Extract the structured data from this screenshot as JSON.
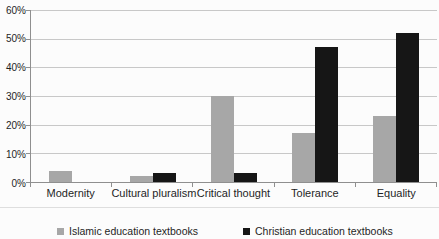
{
  "chart_data": {
    "type": "bar",
    "title": "",
    "categories": [
      "Modernity",
      "Cultural pluralism",
      "Critical thought",
      "Tolerance",
      "Equality"
    ],
    "series": [
      {
        "name": "Islamic education textbooks",
        "color": "#a7a7a7",
        "values": [
          4,
          2,
          30,
          17,
          23
        ]
      },
      {
        "name": "Christian education textbooks",
        "color": "#161616",
        "values": [
          0,
          3,
          3,
          47,
          52
        ]
      }
    ],
    "xlabel": "",
    "ylabel": "",
    "ylim": [
      0,
      60
    ],
    "ytick_step": 10,
    "ytick_labels": [
      "0%",
      "10%",
      "20%",
      "30%",
      "40%",
      "50%",
      "60%"
    ],
    "grid": true,
    "legend_position": "bottom",
    "colors": {
      "gridline": "#c8c8c8",
      "axis": "#8f8f8f",
      "text": "#1f1f1f",
      "background": "#fcfcfc"
    }
  }
}
